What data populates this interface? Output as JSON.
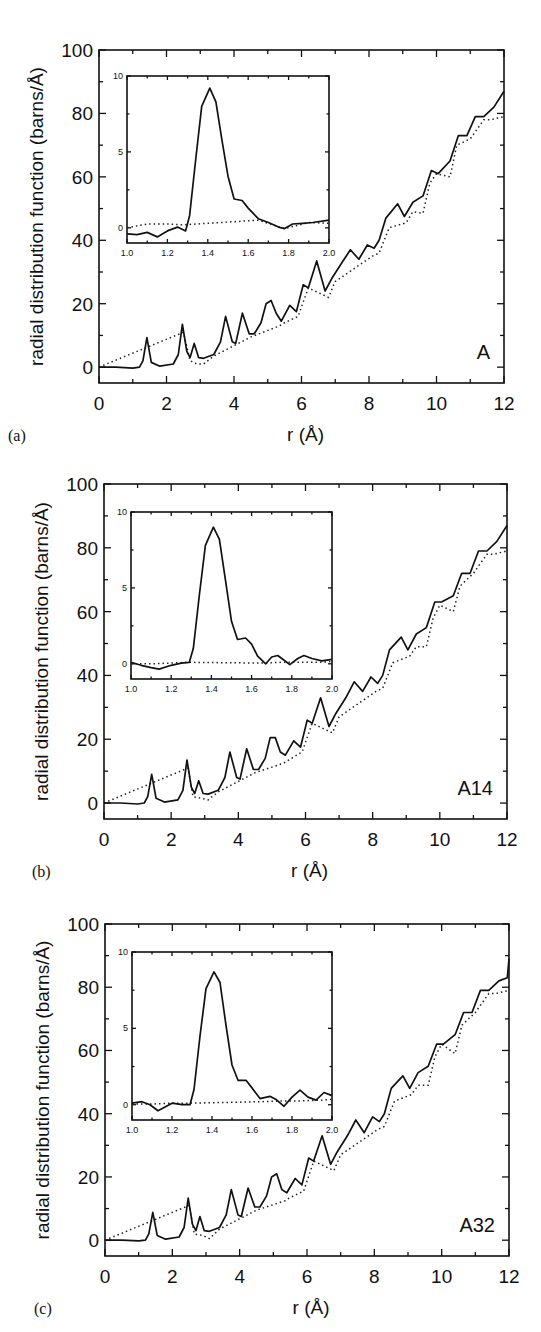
{
  "figure": {
    "panels": [
      {
        "id": "a",
        "panel_label": "(a)",
        "sample_label": "A",
        "frame": {
          "left": 99,
          "top": 50,
          "right": 504,
          "bottom": 383
        },
        "inset_frame": {
          "left": 127,
          "top": 76,
          "right": 329,
          "bottom": 243
        },
        "letter_pos": {
          "x": 8,
          "y": 413
        },
        "sample_pos": {
          "x": 455,
          "y": 363
        }
      },
      {
        "id": "b",
        "panel_label": "(b)",
        "sample_label": "A14",
        "frame": {
          "left": 104,
          "top": 484,
          "right": 507,
          "bottom": 819
        },
        "inset_frame": {
          "left": 131,
          "top": 512,
          "right": 332,
          "bottom": 679
        },
        "letter_pos": {
          "x": 32,
          "y": 891
        },
        "sample_pos": {
          "x": 457,
          "y": 811
        }
      },
      {
        "id": "c",
        "panel_label": "(c)",
        "sample_label": "A32",
        "frame": {
          "left": 105,
          "top": 924,
          "right": 509,
          "bottom": 1256
        },
        "inset_frame": {
          "left": 132,
          "top": 952,
          "right": 332,
          "bottom": 1120
        },
        "letter_pos": {
          "x": 34,
          "y": 1330
        },
        "sample_pos": {
          "x": 458,
          "y": 1250
        }
      }
    ],
    "main_axes": {
      "xlabel": "r (Å)",
      "ylabel": "radial distribution function (barns/Å)",
      "xlim": [
        0,
        12
      ],
      "ylim": [
        -5,
        100
      ],
      "xticks": [
        "0",
        "2",
        "4",
        "6",
        "8",
        "10",
        "12"
      ],
      "yticks": [
        "0",
        "20",
        "40",
        "60",
        "80",
        "100"
      ]
    },
    "inset_axes": {
      "xlim": [
        1.0,
        2.0
      ],
      "ylim": [
        -1,
        10
      ],
      "xticks": [
        "1.0",
        "1.2",
        "1.4",
        "1.6",
        "1.8",
        "2.0"
      ],
      "yticks": [
        "0",
        "5",
        "10"
      ]
    }
  },
  "chart_data": [
    {
      "type": "line",
      "title": "(a) A",
      "xlabel": "r (Å)",
      "ylabel": "radial distribution function (barns/Å)",
      "xlim": [
        0,
        12
      ],
      "ylim": [
        -5,
        100
      ],
      "grid": false,
      "series": [
        {
          "name": "experiment (solid)",
          "style": "solid",
          "x": [
            0,
            0.5,
            1.0,
            1.2,
            1.3,
            1.42,
            1.55,
            1.8,
            2.2,
            2.35,
            2.47,
            2.6,
            2.7,
            2.82,
            2.95,
            3.1,
            3.4,
            3.6,
            3.75,
            3.95,
            4.05,
            4.25,
            4.45,
            4.6,
            4.8,
            4.95,
            5.1,
            5.25,
            5.4,
            5.65,
            5.85,
            6.05,
            6.2,
            6.45,
            6.7,
            6.9,
            7.2,
            7.45,
            7.7,
            7.95,
            8.15,
            8.3,
            8.5,
            8.85,
            9.05,
            9.3,
            9.6,
            9.85,
            10.05,
            10.4,
            10.65,
            10.9,
            11.15,
            11.4,
            11.7,
            12.0
          ],
          "y": [
            0,
            0,
            -0.3,
            0,
            2,
            9.3,
            1.5,
            0.3,
            1,
            4,
            13.5,
            5,
            3,
            7.5,
            3,
            2.8,
            4,
            8,
            16,
            8,
            7.5,
            17,
            10.5,
            10.5,
            14,
            20,
            21,
            17,
            14.5,
            19.5,
            17.5,
            26,
            25,
            33.5,
            24,
            28,
            33,
            37,
            34,
            38.5,
            37.5,
            40,
            47,
            51.5,
            47.5,
            52,
            54,
            62,
            61,
            65,
            73,
            73,
            79,
            79,
            82,
            87
          ]
        },
        {
          "name": "model (dotted)",
          "style": "dotted",
          "x": [
            0,
            2.5,
            2.7,
            2.9,
            3.1,
            3.4,
            4.5,
            5.35,
            5.5,
            5.9,
            6.2,
            6.8,
            7.0,
            8.1,
            8.3,
            8.6,
            9.1,
            9.3,
            9.6,
            9.8,
            10.0,
            10.4,
            10.6,
            11.0,
            11.4,
            11.6,
            12.0
          ],
          "y": [
            0,
            11,
            2,
            1,
            1,
            3.5,
            9.5,
            13,
            14,
            16,
            25,
            22,
            27,
            35,
            36,
            44,
            45.5,
            49,
            48.5,
            58,
            61,
            60,
            70,
            72,
            78,
            78,
            79
          ]
        }
      ],
      "inset": {
        "type": "line",
        "xlim": [
          1.0,
          2.0
        ],
        "ylim": [
          -1,
          10
        ],
        "series": [
          {
            "name": "experiment (solid)",
            "style": "solid",
            "x": [
              1.0,
              1.05,
              1.1,
              1.15,
              1.2,
              1.25,
              1.29,
              1.31,
              1.34,
              1.37,
              1.41,
              1.44,
              1.47,
              1.5,
              1.53,
              1.57,
              1.6,
              1.65,
              1.7,
              1.75,
              1.78,
              1.82,
              1.87,
              1.92,
              2.0
            ],
            "y": [
              -0.4,
              -0.45,
              -0.3,
              -0.6,
              -0.2,
              0.05,
              -0.2,
              0.8,
              4.5,
              8.0,
              9.2,
              8.3,
              5.8,
              3.4,
              1.9,
              1.8,
              1.3,
              0.6,
              0.35,
              0.05,
              -0.05,
              0.25,
              0.3,
              0.35,
              0.5
            ]
          },
          {
            "name": "model (dotted)",
            "style": "dotted",
            "x": [
              1.0,
              1.1,
              1.2,
              1.28,
              1.65,
              1.78,
              1.9,
              2.0
            ],
            "y": [
              0.0,
              0.25,
              0.25,
              0.2,
              0.5,
              -0.05,
              0.35,
              0.3
            ]
          }
        ]
      }
    },
    {
      "type": "line",
      "title": "(b) A14",
      "xlabel": "r (Å)",
      "ylabel": "radial distribution function (barns/Å)",
      "xlim": [
        0,
        12
      ],
      "ylim": [
        -5,
        100
      ],
      "grid": false,
      "series": [
        {
          "name": "experiment (solid)",
          "style": "solid",
          "x": [
            0,
            0.5,
            1.0,
            1.2,
            1.3,
            1.42,
            1.55,
            1.8,
            2.2,
            2.35,
            2.47,
            2.6,
            2.7,
            2.82,
            2.95,
            3.1,
            3.4,
            3.6,
            3.75,
            3.95,
            4.05,
            4.25,
            4.45,
            4.6,
            4.8,
            4.95,
            5.1,
            5.25,
            5.4,
            5.65,
            5.85,
            6.05,
            6.2,
            6.45,
            6.7,
            6.9,
            7.2,
            7.45,
            7.7,
            7.95,
            8.15,
            8.3,
            8.5,
            8.85,
            9.05,
            9.3,
            9.6,
            9.85,
            10.05,
            10.4,
            10.65,
            10.9,
            11.15,
            11.4,
            11.7,
            12.0
          ],
          "y": [
            0,
            0,
            -0.3,
            0,
            2,
            9.0,
            1.5,
            0.3,
            1,
            4,
            13.5,
            5,
            3,
            7,
            3,
            2.8,
            4,
            8,
            16,
            8,
            7.5,
            17,
            10.5,
            10.5,
            14,
            20.5,
            20.5,
            16,
            15,
            19.5,
            17.5,
            26,
            25,
            33,
            24,
            28,
            33,
            38,
            35,
            39.5,
            37.5,
            40,
            48,
            52,
            48,
            53,
            55,
            63,
            63,
            65,
            72,
            72,
            79,
            79,
            82,
            87
          ]
        },
        {
          "name": "model (dotted)",
          "style": "dotted",
          "x": [
            0,
            2.5,
            2.65,
            2.9,
            3.1,
            3.4,
            4.5,
            5.35,
            5.5,
            5.9,
            6.2,
            6.8,
            7.0,
            8.1,
            8.3,
            8.6,
            9.1,
            9.3,
            9.6,
            9.8,
            10.0,
            10.4,
            10.6,
            11.0,
            11.4,
            11.6,
            12.0
          ],
          "y": [
            0,
            11,
            2,
            1.5,
            1,
            3.5,
            9.5,
            12.5,
            13.5,
            16,
            25,
            22,
            27,
            35,
            36,
            44,
            46,
            49,
            49,
            58,
            62,
            60,
            68,
            72,
            78,
            78,
            79
          ]
        }
      ],
      "inset": {
        "type": "line",
        "xlim": [
          1.0,
          2.0
        ],
        "ylim": [
          -1,
          10
        ],
        "series": [
          {
            "name": "experiment (solid)",
            "style": "solid",
            "x": [
              1.0,
              1.05,
              1.1,
              1.14,
              1.2,
              1.25,
              1.29,
              1.31,
              1.34,
              1.37,
              1.41,
              1.44,
              1.47,
              1.5,
              1.53,
              1.57,
              1.6,
              1.63,
              1.67,
              1.7,
              1.73,
              1.76,
              1.79,
              1.83,
              1.86,
              1.9,
              1.95,
              2.0
            ],
            "y": [
              0.1,
              -0.1,
              -0.25,
              -0.35,
              -0.1,
              0.05,
              0.1,
              1.0,
              4.5,
              7.8,
              9.0,
              8.2,
              5.5,
              2.8,
              1.6,
              1.7,
              1.3,
              0.5,
              0.0,
              0.45,
              0.55,
              0.25,
              -0.05,
              0.35,
              0.55,
              0.35,
              0.2,
              0.3
            ]
          },
          {
            "name": "model (dotted)",
            "style": "dotted",
            "x": [
              1.0,
              1.1,
              1.2,
              1.28,
              1.65,
              1.75,
              1.85,
              1.95,
              2.0
            ],
            "y": [
              0.0,
              0.0,
              0.05,
              0.1,
              0.05,
              0.1,
              0.1,
              0.1,
              0.15
            ]
          }
        ]
      }
    },
    {
      "type": "line",
      "title": "(c) A32",
      "xlabel": "r (Å)",
      "ylabel": "radial distribution function (barns/Å)",
      "xlim": [
        0,
        12
      ],
      "ylim": [
        -5,
        100
      ],
      "grid": false,
      "series": [
        {
          "name": "experiment (solid)",
          "style": "solid",
          "x": [
            0,
            0.5,
            1.0,
            1.2,
            1.3,
            1.42,
            1.55,
            1.8,
            2.2,
            2.35,
            2.47,
            2.6,
            2.7,
            2.82,
            2.95,
            3.1,
            3.4,
            3.6,
            3.75,
            3.95,
            4.05,
            4.25,
            4.45,
            4.6,
            4.8,
            4.95,
            5.1,
            5.25,
            5.4,
            5.65,
            5.85,
            6.05,
            6.2,
            6.45,
            6.7,
            6.9,
            7.2,
            7.45,
            7.7,
            7.95,
            8.15,
            8.3,
            8.5,
            8.85,
            9.05,
            9.3,
            9.6,
            9.85,
            10.05,
            10.4,
            10.65,
            10.9,
            11.15,
            11.4,
            11.7,
            11.95,
            12.0
          ],
          "y": [
            0,
            0,
            -0.2,
            0,
            2,
            8.8,
            1.5,
            0.3,
            1,
            4,
            13.3,
            5,
            3,
            7.5,
            3,
            2.8,
            4,
            8,
            16,
            8,
            7.5,
            16.5,
            10.5,
            10.5,
            14,
            20,
            21,
            16,
            15,
            19.5,
            17.5,
            26,
            25,
            33,
            24,
            28,
            33,
            38,
            34,
            39,
            37.5,
            40,
            48,
            52,
            48,
            53,
            55,
            62,
            62,
            65,
            72,
            72,
            79,
            79,
            82,
            83,
            89
          ]
        },
        {
          "name": "model (dotted)",
          "style": "dotted",
          "x": [
            0,
            2.5,
            2.65,
            2.9,
            3.1,
            3.4,
            4.5,
            5.35,
            5.5,
            5.9,
            6.2,
            6.8,
            7.0,
            8.1,
            8.3,
            8.6,
            9.1,
            9.3,
            9.6,
            9.8,
            10.0,
            10.4,
            10.6,
            11.0,
            11.4,
            11.6,
            12.0
          ],
          "y": [
            0,
            11,
            2,
            1.5,
            0.5,
            3.5,
            9.5,
            12.5,
            13.5,
            15.5,
            25,
            22,
            27,
            35,
            36,
            44,
            46,
            49,
            49,
            58,
            62,
            59,
            68,
            72,
            78,
            78,
            79
          ]
        }
      ],
      "inset": {
        "type": "line",
        "xlim": [
          1.0,
          2.0
        ],
        "ylim": [
          -1,
          10
        ],
        "series": [
          {
            "name": "experiment (solid)",
            "style": "solid",
            "x": [
              1.0,
              1.05,
              1.09,
              1.13,
              1.2,
              1.25,
              1.29,
              1.31,
              1.34,
              1.37,
              1.41,
              1.44,
              1.47,
              1.5,
              1.53,
              1.57,
              1.6,
              1.64,
              1.69,
              1.72,
              1.76,
              1.8,
              1.84,
              1.88,
              1.92,
              1.96,
              2.0
            ],
            "y": [
              0.1,
              0.2,
              0.0,
              -0.4,
              0.1,
              0.0,
              0.0,
              1.0,
              4.5,
              7.6,
              8.7,
              8.0,
              5.2,
              2.6,
              1.6,
              1.6,
              1.1,
              0.4,
              0.55,
              0.35,
              -0.1,
              0.5,
              0.95,
              0.5,
              0.3,
              0.8,
              0.6
            ]
          },
          {
            "name": "model (dotted)",
            "style": "dotted",
            "x": [
              1.0,
              1.1,
              1.2,
              1.28,
              1.65,
              1.75,
              1.85,
              1.95,
              2.0
            ],
            "y": [
              0.05,
              0.05,
              0.1,
              0.1,
              0.2,
              0.25,
              0.25,
              0.3,
              0.35
            ]
          }
        ]
      }
    }
  ]
}
